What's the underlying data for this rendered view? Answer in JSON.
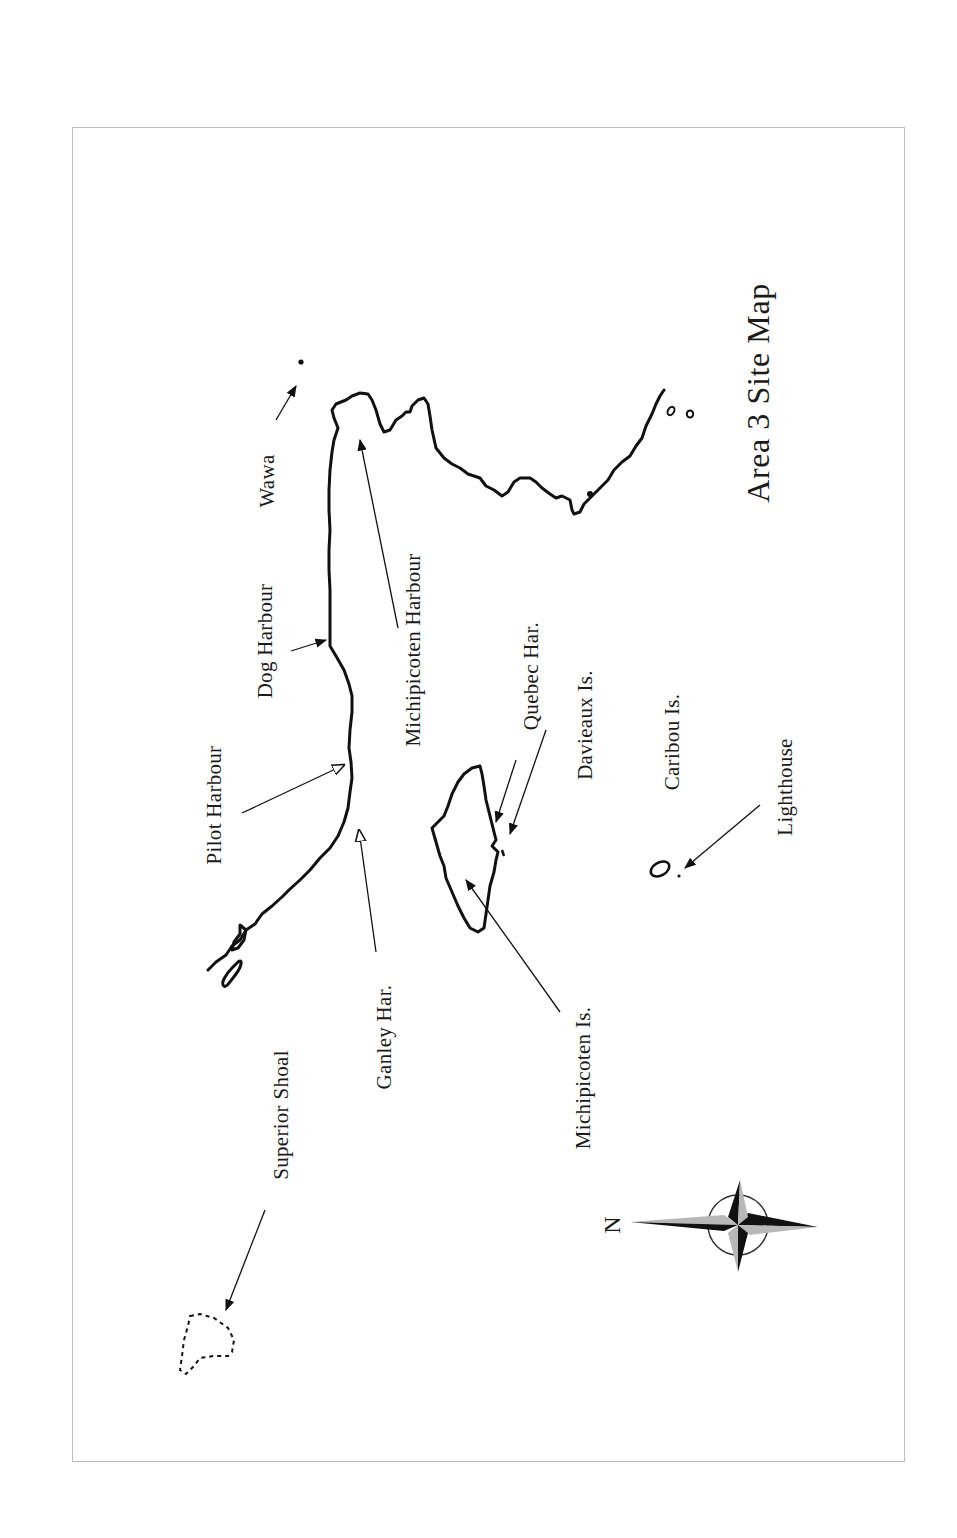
{
  "map": {
    "title": "Area 3  Site Map",
    "north_label": "N",
    "labels": {
      "wawa": "Wawa",
      "dog_harbour": "Dog Harbour",
      "pilot_harbour": "Pilot Harbour",
      "superior_shoal": "Superior Shoal",
      "ganley_har": "Ganley Har.",
      "michipicoten_harbour": "Michipicoten Harbour",
      "quebec_har": "Quebec Har.",
      "davieaux_is": "Davieaux Is.",
      "caribou_is": "Caribou Is.",
      "lighthouse": "Lighthouse",
      "michipicoten_is": "Michipicoten Is."
    },
    "icons": {
      "compass": "compass-rose-icon",
      "town": "town-dot-icon"
    },
    "colors": {
      "line": "#111111",
      "frame": "#bdbdbd",
      "compass_light": "#b8b8b8",
      "compass_dark": "#111111"
    }
  }
}
